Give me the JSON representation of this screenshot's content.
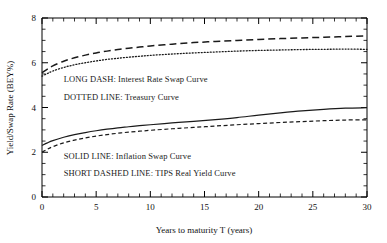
{
  "chart_data": {
    "type": "line",
    "title": "",
    "xlabel": "Years to maturity T (years)",
    "ylabel": "Yield/Swap Rate (BEY%)",
    "xlim": [
      0,
      30
    ],
    "ylim": [
      0,
      8
    ],
    "xticks": [
      0,
      5,
      10,
      15,
      20,
      25,
      30
    ],
    "xtick_labels": [
      "0",
      "5",
      "10",
      "15",
      "20",
      "25",
      "30"
    ],
    "yticks": [
      0,
      2,
      4,
      6,
      8
    ],
    "ytick_labels": [
      "0",
      "2",
      "4",
      "6",
      "8"
    ],
    "x_minor_tick_interval": 1,
    "y_minor_tick_interval": 0.5,
    "grid": false,
    "legend_position": "inside-plot-left",
    "x": [
      0,
      0.5,
      1,
      2,
      3,
      4,
      5,
      6,
      7,
      8,
      9,
      10,
      12,
      14,
      16,
      18,
      20,
      22,
      24,
      26,
      28,
      30
    ],
    "series": [
      {
        "name": "Interest Rate Swap Curve",
        "style": "long dash",
        "values": [
          5.55,
          5.72,
          5.86,
          6.07,
          6.22,
          6.34,
          6.44,
          6.52,
          6.59,
          6.65,
          6.7,
          6.75,
          6.83,
          6.9,
          6.95,
          7.0,
          7.04,
          7.08,
          7.11,
          7.14,
          7.17,
          7.2
        ]
      },
      {
        "name": "Treasury Curve",
        "style": "dotted",
        "values": [
          5.4,
          5.52,
          5.63,
          5.79,
          5.91,
          6.0,
          6.08,
          6.15,
          6.2,
          6.25,
          6.29,
          6.33,
          6.39,
          6.44,
          6.48,
          6.52,
          6.55,
          6.57,
          6.59,
          6.6,
          6.61,
          6.6
        ]
      },
      {
        "name": "Inflation Swap Curve",
        "style": "solid",
        "values": [
          2.3,
          2.42,
          2.52,
          2.67,
          2.79,
          2.88,
          2.96,
          3.03,
          3.09,
          3.14,
          3.19,
          3.23,
          3.31,
          3.38,
          3.46,
          3.55,
          3.66,
          3.76,
          3.85,
          3.92,
          3.97,
          3.99
        ]
      },
      {
        "name": "TIPS Real Yield Curve",
        "style": "short dashed",
        "values": [
          2.0,
          2.14,
          2.25,
          2.42,
          2.54,
          2.64,
          2.72,
          2.79,
          2.85,
          2.9,
          2.94,
          2.98,
          3.05,
          3.11,
          3.17,
          3.23,
          3.28,
          3.33,
          3.37,
          3.41,
          3.44,
          3.45
        ]
      }
    ],
    "annotations": [
      {
        "key": "long_dash",
        "text": "LONG DASH:  Interest Rate Swap Curve",
        "x": 2.0,
        "y": 5.15
      },
      {
        "key": "dotted",
        "text": "DOTTED LINE:  Treasury Curve",
        "x": 2.0,
        "y": 4.35
      },
      {
        "key": "solid",
        "text": "SOLID LINE:  Inflation Swap Curve",
        "x": 2.0,
        "y": 1.72
      },
      {
        "key": "short_dashed",
        "text": "SHORT DASHED LINE:  TIPS Real Yield Curve",
        "x": 2.0,
        "y": 0.92
      }
    ],
    "colors": {
      "axis": "#000000",
      "interest_rate_swap": "#1a1a1a",
      "treasury": "#1a1a1a",
      "inflation_swap": "#1a1a1a",
      "tips_real_yield": "#1a1a1a",
      "background": "#ffffff"
    }
  }
}
